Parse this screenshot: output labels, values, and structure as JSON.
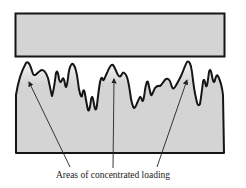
{
  "diagram": {
    "caption": "Areas of concentrated loading",
    "colors": {
      "fill": "#d4d4d4",
      "stroke": "#151515",
      "background": "#ffffff",
      "peak_highlight": "#f2f2f2"
    },
    "upper_body": {
      "label": "upper surface block"
    },
    "lower_body": {
      "label": "rough surface body"
    },
    "arrows": [
      {
        "from": [
          70,
          167
        ],
        "to": [
          28,
          80
        ]
      },
      {
        "from": [
          113,
          168
        ],
        "to": [
          114,
          77
        ]
      },
      {
        "from": [
          157,
          167
        ],
        "to": [
          188,
          78
        ]
      }
    ]
  }
}
